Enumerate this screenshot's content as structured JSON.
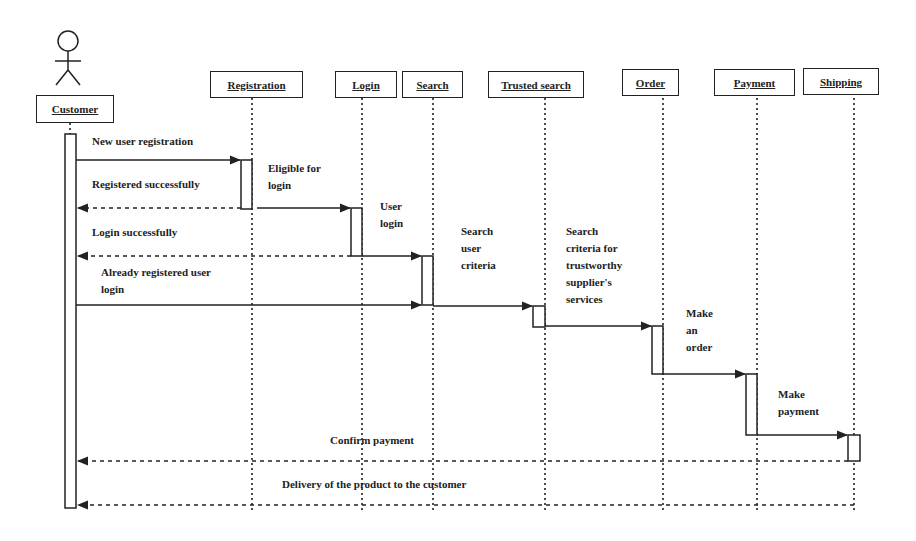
{
  "diagram": {
    "type": "UML sequence diagram",
    "actor": {
      "label": "Customer",
      "icon": "stick-figure-icon"
    },
    "objects": [
      {
        "id": "registration",
        "label": "Registration"
      },
      {
        "id": "login",
        "label": "Login"
      },
      {
        "id": "search",
        "label": "Search"
      },
      {
        "id": "trusted_search",
        "label": "Trusted search"
      },
      {
        "id": "order",
        "label": "Order"
      },
      {
        "id": "payment",
        "label": "Payment"
      },
      {
        "id": "shipping",
        "label": "Shipping"
      }
    ],
    "messages": [
      {
        "from": "Customer",
        "to": "Registration",
        "label": "New user registration",
        "style": "solid"
      },
      {
        "from": "Registration",
        "to": "Customer",
        "label": "Registered successfully",
        "style": "dashed"
      },
      {
        "from": "Registration",
        "to": "Login",
        "label": "Eligible for login",
        "style": "solid"
      },
      {
        "from": "Login",
        "to": "Customer",
        "label": "Login successfully",
        "style": "dashed"
      },
      {
        "from": "Login",
        "to": "Search",
        "label": "User login",
        "style": "solid"
      },
      {
        "from": "Customer",
        "to": "Search",
        "label": "Already registered user login",
        "style": "solid"
      },
      {
        "from": "Search",
        "to": "Trusted search",
        "label": "Search user criteria",
        "style": "solid"
      },
      {
        "from": "Trusted search",
        "to": "Order",
        "label": "Search criteria for trustworthy supplier's services",
        "style": "solid"
      },
      {
        "from": "Order",
        "to": "Payment",
        "label": "Make an order",
        "style": "solid"
      },
      {
        "from": "Payment",
        "to": "Shipping",
        "label": "Make payment",
        "style": "solid"
      },
      {
        "from": "Shipping",
        "to": "Customer",
        "label": "Confirm payment",
        "style": "dashed"
      },
      {
        "from": "Shipping",
        "to": "Customer",
        "label": "Delivery of the product to the customer",
        "style": "dashed"
      }
    ],
    "labels": {
      "new_user_registration": "New user registration",
      "registered_successfully": "Registered successfully",
      "eligible_line1": "Eligible for",
      "eligible_line2": "login",
      "user_login_line1": "User",
      "user_login_line2": "login",
      "login_successfully": "Login successfully",
      "already_registered_line1": "Already registered user",
      "already_registered_line2": "login",
      "search_user_criteria_line1": "Search",
      "search_user_criteria_line2": "user",
      "search_user_criteria_line3": "criteria",
      "trustworthy_line1": "Search",
      "trustworthy_line2": "criteria for",
      "trustworthy_line3": "trustworthy",
      "trustworthy_line4": "supplier's",
      "trustworthy_line5": "services",
      "make_order_line1": "Make",
      "make_order_line2": "an",
      "make_order_line3": "order",
      "make_payment_line1": "Make",
      "make_payment_line2": "payment",
      "confirm_payment": "Confirm payment",
      "delivery": "Delivery of the product to the customer"
    },
    "colors": {
      "line": "#222222",
      "background": "#ffffff"
    }
  }
}
